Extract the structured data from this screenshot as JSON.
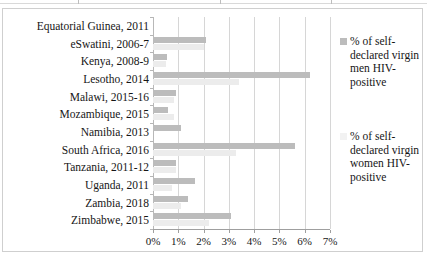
{
  "chart_data": {
    "type": "bar",
    "orientation": "horizontal",
    "title": "",
    "xlabel": "",
    "ylabel": "",
    "xlim": [
      0,
      7
    ],
    "grid": true,
    "legend_position": "right",
    "x_tick_labels": [
      "0%",
      "1%",
      "2%",
      "3%",
      "4%",
      "5%",
      "6%",
      "7%"
    ],
    "x_tick_values": [
      0,
      1,
      2,
      3,
      4,
      5,
      6,
      7
    ],
    "categories": [
      "Equatorial Guinea, 2011",
      "eSwatini, 2006-7",
      "Kenya, 2008-9",
      "Lesotho, 2014",
      "Malawi, 2015-16",
      "Mozambique, 2015",
      "Namibia, 2013",
      "South Africa, 2016",
      "Tanzania, 2011-12",
      "Uganda, 2011",
      "Zambia, 2018",
      "Zimbabwe, 2015"
    ],
    "series": [
      {
        "name": "% of self-declared virgin men HIV-positive",
        "color": "#bcbcbc",
        "values": [
          0.0,
          2.1,
          0.55,
          6.2,
          0.9,
          0.6,
          1.1,
          5.6,
          0.9,
          1.65,
          1.4,
          3.1
        ]
      },
      {
        "name": "% of self-declared virgin women HIV-positive",
        "color": "#f2f2f2",
        "values": [
          0.0,
          2.0,
          0.5,
          3.4,
          0.85,
          0.85,
          0.0,
          3.3,
          0.9,
          0.75,
          1.1,
          2.2
        ]
      }
    ]
  },
  "legend": {
    "entries": [
      {
        "label": "% of self-declared virgin men HIV-positive"
      },
      {
        "label": "% of self-declared virgin women HIV-positive"
      }
    ]
  }
}
